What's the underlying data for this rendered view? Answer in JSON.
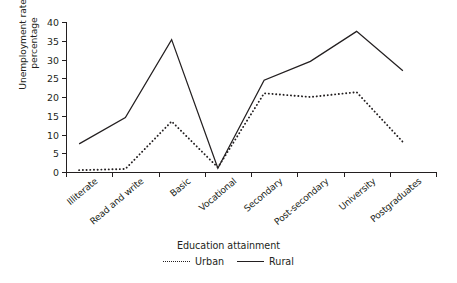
{
  "chart_data": {
    "type": "line",
    "title": "",
    "xlabel": "Education attainment",
    "ylabel": "Unemployment rate,\npercentage",
    "categories": [
      "Illiterate",
      "Read and write",
      "Basic",
      "Vocational",
      "Secondary",
      "Post-secondary",
      "University",
      "Postgraduates"
    ],
    "series": [
      {
        "name": "Urban",
        "style": "dotted",
        "color": "#231f20",
        "values": [
          0.5,
          0.8,
          13.5,
          1.2,
          21.0,
          20.0,
          21.3,
          8.0
        ]
      },
      {
        "name": "Rural",
        "style": "solid",
        "color": "#231f20",
        "values": [
          7.5,
          14.5,
          35.3,
          1.0,
          24.5,
          29.5,
          37.5,
          27.0
        ]
      }
    ],
    "ylim": [
      0,
      40
    ],
    "yticks": [
      0,
      5,
      10,
      15,
      20,
      25,
      30,
      35,
      40
    ],
    "ytick_labels": [
      "0",
      "5",
      "10",
      "15",
      "20",
      "25",
      "30",
      "35",
      "40"
    ],
    "grid": false,
    "legend_position": "bottom"
  },
  "axes": {
    "y_title_line1": "Unemployment rate,",
    "y_title_line2": "percentage",
    "x_title": "Education attainment"
  },
  "legend": {
    "urban_label": "Urban",
    "rural_label": "Rural"
  }
}
